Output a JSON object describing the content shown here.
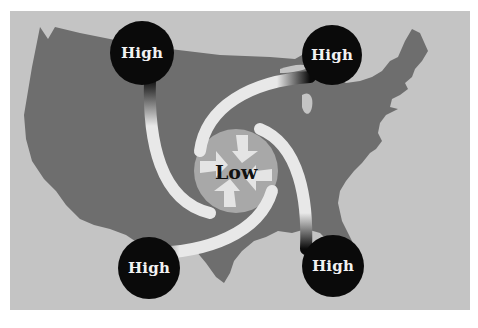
{
  "diagram": {
    "background_map": "contiguous-united-states-silhouette",
    "center": {
      "label": "Low",
      "type": "low-pressure"
    },
    "nodes": [
      {
        "id": "high-northwest",
        "label": "High",
        "type": "high-pressure"
      },
      {
        "id": "high-northeast",
        "label": "High",
        "type": "high-pressure"
      },
      {
        "id": "high-southwest",
        "label": "High",
        "type": "high-pressure"
      },
      {
        "id": "high-southeast",
        "label": "High",
        "type": "high-pressure"
      }
    ],
    "edges": [
      {
        "from": "high-northwest",
        "to": "center",
        "style": "curved-arrow"
      },
      {
        "from": "high-northeast",
        "to": "center",
        "style": "curved-arrow"
      },
      {
        "from": "high-southwest",
        "to": "center",
        "style": "curved-arrow"
      },
      {
        "from": "high-southeast",
        "to": "center",
        "style": "curved-arrow"
      }
    ],
    "colors": {
      "frame_background": "#c4c4c4",
      "map": "#6e6e6e",
      "high_node": "#0a0a0a",
      "arrow": "#e8e8e8",
      "low_center": "#a8a8a8"
    }
  }
}
